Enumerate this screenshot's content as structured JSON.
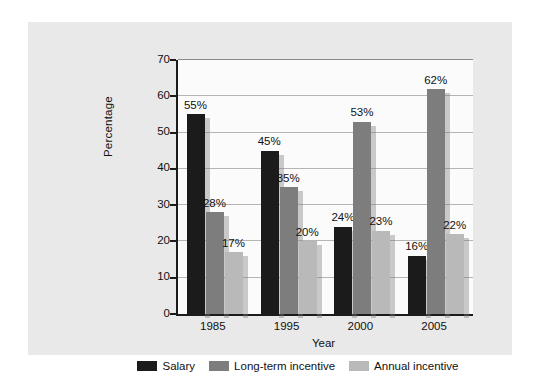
{
  "chart_data": {
    "type": "bar",
    "title": "",
    "subtitle": "",
    "xlabel": "Year",
    "ylabel": "Percentage",
    "categories": [
      "1985",
      "1995",
      "2000",
      "2005"
    ],
    "series": [
      {
        "name": "Salary",
        "color": "#1b1b1b",
        "values": [
          55,
          45,
          24,
          16
        ],
        "labels": [
          "55%",
          "45%",
          "24%",
          "16%"
        ]
      },
      {
        "name": "Long-term incentive",
        "color": "#7d7d7d",
        "values": [
          28,
          35,
          53,
          62
        ],
        "labels": [
          "28%",
          "35%",
          "53%",
          "62%"
        ]
      },
      {
        "name": "Annual incentive",
        "color": "#b9b9b9",
        "values": [
          17,
          20,
          23,
          22
        ],
        "labels": [
          "17%",
          "20%",
          "23%",
          "22%"
        ]
      }
    ],
    "ylim": [
      0,
      70
    ],
    "yticks": [
      0,
      10,
      20,
      30,
      40,
      50,
      60,
      70
    ],
    "ytick_labels": [
      "0",
      "10",
      "20",
      "30",
      "40",
      "50",
      "60",
      "70"
    ],
    "grid": true,
    "legend_position": "bottom",
    "value_labels_shown": true
  },
  "colors": {
    "page_background": "#ffffff",
    "figure_panel": "#e9e9e9",
    "plot_background": "#fbfbfb",
    "axis": "#1b1b1b",
    "gridline": "#b5b5b5",
    "text": "#111111",
    "salary": "#1b1b1b",
    "long_term_incentive": "#7d7d7d",
    "annual_incentive": "#b9b9b9"
  }
}
